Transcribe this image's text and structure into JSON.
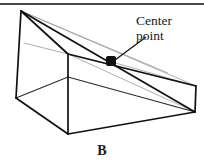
{
  "figure": {
    "panel_letter": "B",
    "annotation": {
      "line1": "Center",
      "line2": "point"
    },
    "colors": {
      "stroke_dark": "#1a1a1a",
      "stroke_faint": "#9a9a9a",
      "rule": "#4a4a4a",
      "background": "#ffffff",
      "marker": "#111111"
    },
    "geometry": {
      "apex_top_left": [
        21,
        11
      ],
      "left_bottom": [
        16,
        98
      ],
      "front_bottom": [
        68,
        134
      ],
      "mid_vertical_top": [
        68,
        54
      ],
      "right_vertex": [
        195,
        112
      ],
      "center_point": [
        112,
        62
      ],
      "back_right_upper": [
        168,
        73
      ],
      "bottom_back_right": [
        196,
        86
      ]
    },
    "leader_line": {
      "from": [
        115,
        60
      ],
      "to": [
        146,
        37
      ]
    }
  }
}
